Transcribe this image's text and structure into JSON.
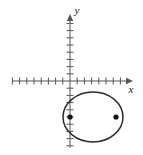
{
  "figure": {
    "background_color": "#ffffff",
    "stroke_color": "#2b2b2b",
    "axis_color": "#555555",
    "width": 143,
    "height": 155
  },
  "axes": {
    "x_axis": {
      "label": "x",
      "label_x": 131,
      "label_y": 93,
      "y": 81,
      "x_start": 12,
      "x_end": 133,
      "arrow": "right",
      "tick_spacing": 7.2,
      "ticks_left": 8,
      "ticks_right": 8,
      "tick_half_length": 3.5
    },
    "y_axis": {
      "label": "y",
      "label_x": 77,
      "label_y": 14,
      "x": 70,
      "y_start": 14,
      "y_end": 148,
      "arrow": "up",
      "tick_spacing": 7.2,
      "ticks_above": 9,
      "ticks_below": 9,
      "tick_half_length": 3.5
    },
    "origin": {
      "x": 70,
      "y": 81
    }
  },
  "chart_data": {
    "type": "scatter",
    "xlabel": "x",
    "ylabel": "y",
    "grid": false,
    "legend": "none",
    "origin_px": {
      "x": 70,
      "y": 81
    },
    "units_per_tick": 1,
    "pixels_per_unit": 7.2,
    "curves": [
      {
        "name": "ellipse",
        "type": "ellipse",
        "center_px": {
          "x": 93,
          "y": 117
        },
        "center_units": {
          "x": 3.2,
          "y": -5.0
        },
        "semi_major_axis_px": 30,
        "semi_minor_axis_px": 25,
        "semi_major_axis_units": 4.2,
        "semi_minor_axis_units": 3.5,
        "orientation": "horizontal",
        "stroke": "#2b2b2b",
        "stroke_width": 1.5,
        "fill": "none"
      }
    ],
    "points": [
      {
        "name": "focus-left",
        "x_px": 70,
        "y_px": 117,
        "x_units": 0.0,
        "y_units": -5.0,
        "radius_px": 2.6,
        "fill": "#111111"
      },
      {
        "name": "focus-right",
        "x_px": 116,
        "y_px": 117,
        "x_units": 6.4,
        "y_units": -5.0,
        "radius_px": 2.6,
        "fill": "#111111"
      }
    ]
  }
}
